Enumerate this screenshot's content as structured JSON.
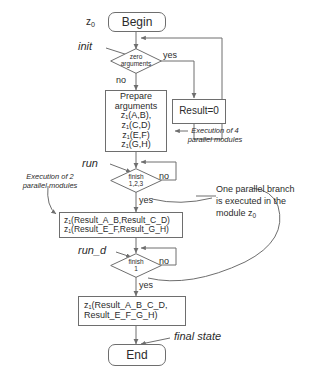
{
  "diagram": {
    "stroke_color": "#6e6e6e",
    "text_color": "#2b2b2b",
    "background": "#ffffff"
  },
  "nodes": {
    "begin": {
      "label": "Begin",
      "marker": "z0",
      "marker_base": "z",
      "marker_sub": "0"
    },
    "end": {
      "label": "End"
    },
    "prepare": {
      "line1": "Prepare",
      "line2": "arguments",
      "line3": "z₁(A,B),",
      "line4": "z₁(C,D)",
      "line5": "z₁(E,F)",
      "line6": "z₁(G,H)"
    },
    "result_zero": {
      "label": "Result=0"
    },
    "results_mid": {
      "line1": "z₁(Result_A_B,Result_C_D)",
      "line2": "z₁(Result_E_F,Result_G_H)"
    },
    "results_final": {
      "line1": "z₁(Result_A_B_C_D,",
      "line2": "Result_E_F_G_H)"
    }
  },
  "decisions": {
    "zero_arguments": {
      "line1": "zero",
      "line2": "arguments",
      "yes": "yes",
      "no": "no"
    },
    "finish_123": {
      "line1": "finish",
      "line2": "1,2,3",
      "yes": "yes",
      "no": "no"
    },
    "finish_1": {
      "line1": "finish",
      "line2": "1",
      "yes": "yes",
      "no": "no"
    }
  },
  "labels": {
    "init": "init",
    "run": "run",
    "run_d": "run_d",
    "final_state": "final state"
  },
  "captions": {
    "exec4": {
      "line1": "Execution of 4",
      "line2": "parallel modules"
    },
    "exec2": {
      "line1": "Execution of 2",
      "line2": "parallel modules"
    }
  },
  "notes": {
    "one_branch": {
      "line1": "One parallel branch",
      "line2": "is executed in the",
      "line3_prefix": "module z",
      "line3_sub": "0"
    }
  }
}
